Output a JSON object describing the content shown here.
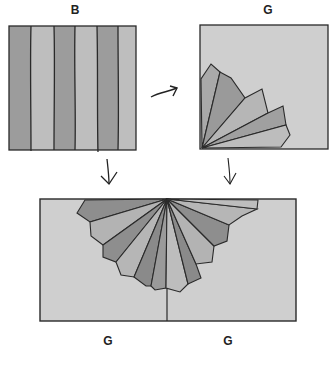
{
  "diagram": {
    "title": "",
    "panels": [
      {
        "id": "panel-b",
        "label": "B",
        "description": "striped square, 6 vertical stripes alternating dark and light"
      },
      {
        "id": "panel-g-top",
        "label": "G",
        "description": "light square with quarter fan of 5 petals in bottom-left corner"
      },
      {
        "id": "panel-bottom",
        "labels": [
          "G",
          "G"
        ],
        "description": "wide rectangle with half fan of 11 petals hanging from top center and a vertical center line"
      }
    ],
    "arrows": [
      {
        "from": "panel-b",
        "to": "panel-g-top",
        "style": "curved-right"
      },
      {
        "from": "panel-b",
        "to": "panel-bottom",
        "style": "down"
      },
      {
        "from": "panel-g-top",
        "to": "panel-bottom",
        "style": "down"
      }
    ],
    "colors": {
      "stripe_dark": "#9c9c9c",
      "stripe_light": "#bebebe",
      "panel_light": "#cfcfcf",
      "petal_dark": "#8e8e8e",
      "petal_mid": "#a9a9a9",
      "petal_light": "#bdbdbd",
      "outline": "#2a2a2a"
    }
  },
  "labels": {
    "b": "B",
    "g_top": "G",
    "g_bottom_left": "G",
    "g_bottom_right": "G"
  }
}
